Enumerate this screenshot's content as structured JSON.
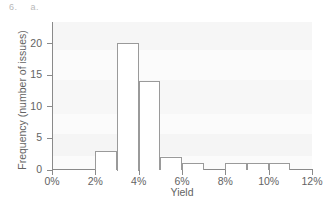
{
  "annotation": {
    "problem_number": "6.",
    "part_label": "a."
  },
  "chart_data": {
    "type": "bar",
    "title": "",
    "subtitle": "",
    "xlabel": "Yield",
    "ylabel": "Frequency (number of issues)",
    "xlim": [
      0,
      12
    ],
    "ylim": [
      0,
      23
    ],
    "grid": false,
    "legend": false,
    "bin_width": 1,
    "x_unit": "%",
    "categories": [
      "0%-1%",
      "1%-2%",
      "2%-3%",
      "3%-4%",
      "4%-5%",
      "5%-6%",
      "6%-7%",
      "7%-8%",
      "8%-9%",
      "9%-10%",
      "10%-11%",
      "11%-12%"
    ],
    "bin_starts": [
      0,
      1,
      2,
      3,
      4,
      5,
      6,
      7,
      8,
      9,
      10,
      11
    ],
    "bin_ends": [
      1,
      2,
      3,
      4,
      5,
      6,
      7,
      8,
      9,
      10,
      11,
      12
    ],
    "values": [
      0,
      0,
      3,
      20,
      14,
      2,
      1,
      0,
      1,
      1,
      1,
      0
    ],
    "xticks": [
      0,
      2,
      4,
      6,
      8,
      10,
      12
    ],
    "xtick_labels": [
      "0%",
      "2%",
      "4%",
      "6%",
      "8%",
      "10%",
      "12%"
    ],
    "yticks": [
      0,
      5,
      10,
      15,
      20
    ],
    "ytick_labels": [
      "0",
      "5",
      "10",
      "15",
      "20"
    ],
    "total_issues": 43,
    "colors": {
      "bar_fill": "#ffffff",
      "bar_outline": "#9a9a9a",
      "axis": "#8a8a8a",
      "text": "#636363",
      "plot_background": "#fbfbfb",
      "annotation": "#b9b9b9"
    }
  }
}
